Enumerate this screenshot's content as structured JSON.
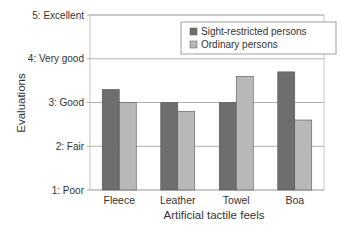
{
  "chart_data": {
    "type": "bar",
    "title": "",
    "xlabel": "Artificial tactile feels",
    "ylabel": "Evaluations",
    "categories": [
      "Fleece",
      "Leather",
      "Towel",
      "Boa"
    ],
    "series": [
      {
        "name": "Sight-restricted persons",
        "color": "#6e6e6e",
        "values": [
          3.3,
          3.0,
          3.0,
          3.7
        ]
      },
      {
        "name": "Ordinary persons",
        "color": "#b8b8b8",
        "values": [
          3.0,
          2.8,
          3.6,
          2.6
        ]
      }
    ],
    "ylim": [
      1,
      5
    ],
    "yticks": [
      {
        "value": 1,
        "label": "1: Poor"
      },
      {
        "value": 2,
        "label": "2: Fair"
      },
      {
        "value": 3,
        "label": "3: Good"
      },
      {
        "value": 4,
        "label": "4: Very good"
      },
      {
        "value": 5,
        "label": "5: Excellent"
      }
    ],
    "grid": true,
    "legend": "top-right"
  }
}
